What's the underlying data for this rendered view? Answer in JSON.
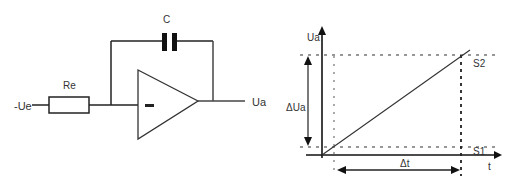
{
  "circuit": {
    "input_label": "-Ue",
    "resistor_label": "Re",
    "capacitor_label": "C",
    "opamp_input_sign": "−",
    "output_label": "Ua"
  },
  "graph": {
    "y_axis_label": "Ua",
    "x_axis_label": "t",
    "delta_y_label": "ΔUa",
    "delta_x_label": "Δt",
    "point_top_label": "S2",
    "point_bottom_label": "S1"
  },
  "colors": {
    "line": "#222222",
    "text": "#333333",
    "background": "#ffffff"
  }
}
